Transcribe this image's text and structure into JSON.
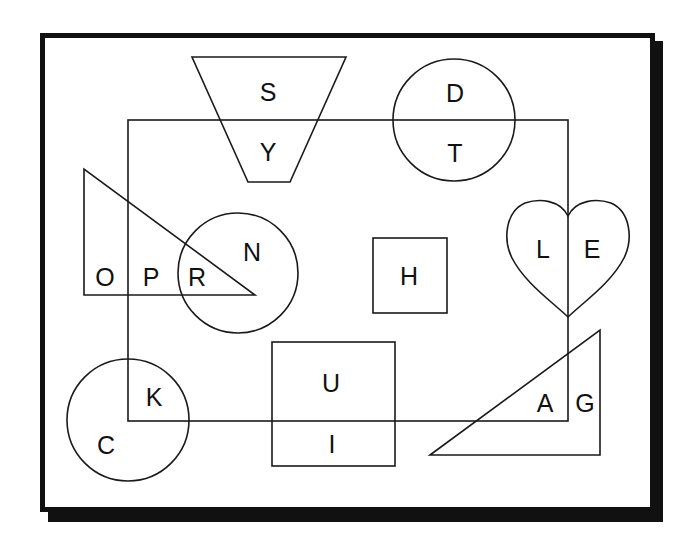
{
  "colors": {
    "background": "#ffffff",
    "stroke": "#1a1a1a",
    "frame": "#111111",
    "text": "#111111"
  },
  "shapes": {
    "rectangle": {
      "name": "large-rectangle"
    },
    "trapezoid": {
      "name": "trapezoid"
    },
    "circle_top": {
      "name": "circle-top"
    },
    "triangle_left": {
      "name": "triangle-left"
    },
    "circle_middle": {
      "name": "circle-middle"
    },
    "square": {
      "name": "square"
    },
    "heart": {
      "name": "heart"
    },
    "circle_bottom": {
      "name": "circle-bottom"
    },
    "rect_bottom": {
      "name": "rectangle-bottom"
    },
    "triangle_right": {
      "name": "triangle-right"
    }
  },
  "labels": {
    "S": "S",
    "Y": "Y",
    "D": "D",
    "T": "T",
    "O": "O",
    "P": "P",
    "R": "R",
    "N": "N",
    "H": "H",
    "L": "L",
    "E": "E",
    "K": "K",
    "C": "C",
    "U": "U",
    "I": "I",
    "A": "A",
    "G": "G"
  }
}
